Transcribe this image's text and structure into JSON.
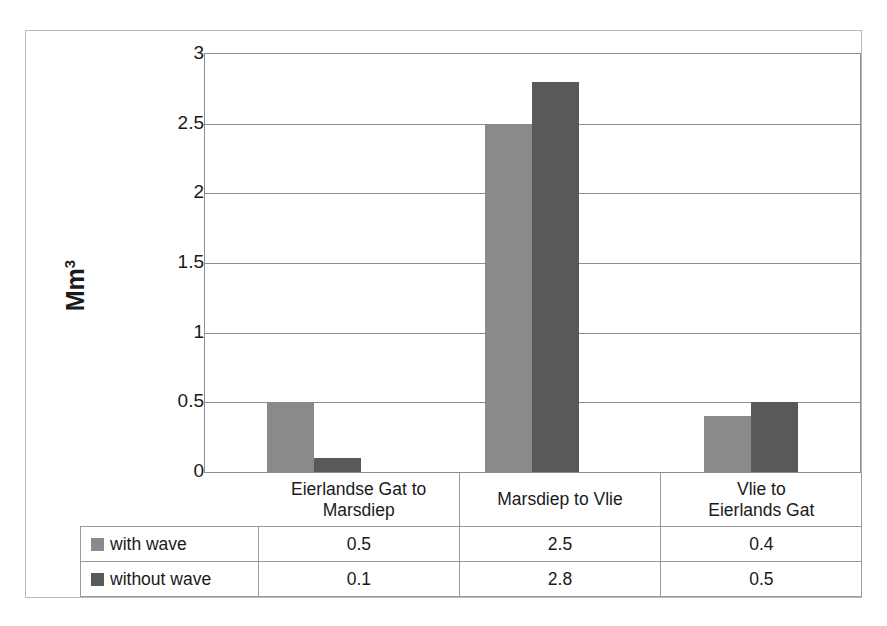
{
  "chart_data": {
    "type": "bar",
    "title": "",
    "subtitle": "",
    "xlabel": "",
    "ylabel": "Mm",
    "ylabel_superscript": "3",
    "categories": [
      "Eierlandse Gat to Marsdiep",
      "Marsdiep to Vlie",
      "Vlie to Eierlands Gat"
    ],
    "category_lines": [
      [
        "Eierlandse Gat to",
        "Marsdiep"
      ],
      [
        "Marsdiep to Vlie"
      ],
      [
        "Vlie to",
        "Eierlands Gat"
      ]
    ],
    "series": [
      {
        "name": "with wave",
        "values": [
          0.5,
          2.5,
          0.4
        ],
        "color": "#8a8a8a"
      },
      {
        "name": "without wave",
        "values": [
          0.1,
          2.8,
          0.5
        ],
        "color": "#595959"
      }
    ],
    "ylim": [
      0,
      3
    ],
    "ytick_values": [
      0,
      0.5,
      1,
      1.5,
      2,
      2.5,
      3
    ],
    "ytick_labels": [
      "0",
      "0.5",
      "1",
      "1.5",
      "2",
      "2.5",
      "3"
    ],
    "grid": true,
    "grid_orientation": "horizontal",
    "legend_position": "data-table-left-column",
    "has_data_table": true
  },
  "data_table": {
    "corner_label": "",
    "column_headers": [
      "Eierlandse Gat to Marsdiep",
      "Marsdiep to Vlie",
      "Vlie to Eierlands Gat"
    ],
    "rows": [
      {
        "label": "with wave",
        "cells": [
          "0.5",
          "2.5",
          "0.4"
        ]
      },
      {
        "label": "without wave",
        "cells": [
          "0.1",
          "2.8",
          "0.5"
        ]
      }
    ]
  },
  "colors": {
    "series_with_wave": "#8a8a8a",
    "series_without_wave": "#595959",
    "gridline": "#8e8e8e",
    "table_border": "#9a9a9a",
    "figure_border": "#b9b9b9",
    "text": "#1a1a1a",
    "background": "#ffffff"
  }
}
